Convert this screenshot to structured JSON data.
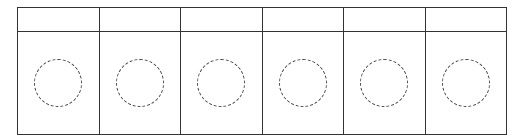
{
  "diagram": {
    "columns": [
      {
        "header": "",
        "shape": "dashed-circle"
      },
      {
        "header": "",
        "shape": "dashed-circle"
      },
      {
        "header": "",
        "shape": "dashed-circle"
      },
      {
        "header": "",
        "shape": "dashed-circle"
      },
      {
        "header": "",
        "shape": "dashed-circle"
      },
      {
        "header": "",
        "shape": "dashed-circle"
      }
    ],
    "colors": {
      "line": "#333333",
      "dash": "#444444",
      "background": "#ffffff"
    }
  }
}
